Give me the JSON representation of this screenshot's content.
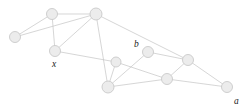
{
  "figure": {
    "background_color": "#ffffff",
    "node_fill_color": "#ececec",
    "node_stroke_color": "#c9c9c9",
    "edge_color": "#c4c4c4",
    "label_color": "#1a1a1a"
  },
  "chart_data": {
    "type": "diagram",
    "title": "",
    "nodes": [
      {
        "id": "n0",
        "x": 15,
        "y": 37,
        "r": 5.5,
        "label": ""
      },
      {
        "id": "n1",
        "x": 52,
        "y": 14,
        "r": 5.5,
        "label": ""
      },
      {
        "id": "n2",
        "x": 96,
        "y": 14,
        "r": 6.0,
        "label": ""
      },
      {
        "id": "n3",
        "x": 55,
        "y": 51,
        "r": 5.5,
        "label": "x"
      },
      {
        "id": "n4",
        "x": 116,
        "y": 62,
        "r": 5.0,
        "label": ""
      },
      {
        "id": "n5",
        "x": 148,
        "y": 52,
        "r": 5.5,
        "label": "b"
      },
      {
        "id": "n6",
        "x": 188,
        "y": 60,
        "r": 5.5,
        "label": ""
      },
      {
        "id": "n7",
        "x": 108,
        "y": 87,
        "r": 6.0,
        "label": ""
      },
      {
        "id": "n8",
        "x": 167,
        "y": 79,
        "r": 5.5,
        "label": ""
      },
      {
        "id": "n9",
        "x": 227,
        "y": 87,
        "r": 5.5,
        "label": "a"
      }
    ],
    "edges": [
      {
        "from": "n0",
        "to": "n1"
      },
      {
        "from": "n0",
        "to": "n2"
      },
      {
        "from": "n1",
        "to": "n3"
      },
      {
        "from": "n1",
        "to": "n2"
      },
      {
        "from": "n2",
        "to": "n3"
      },
      {
        "from": "n2",
        "to": "n7"
      },
      {
        "from": "n2",
        "to": "n6"
      },
      {
        "from": "n3",
        "to": "n4"
      },
      {
        "from": "n4",
        "to": "n7"
      },
      {
        "from": "n4",
        "to": "n8"
      },
      {
        "from": "n5",
        "to": "n7"
      },
      {
        "from": "n5",
        "to": "n6"
      },
      {
        "from": "n6",
        "to": "n8"
      },
      {
        "from": "n6",
        "to": "n9"
      },
      {
        "from": "n7",
        "to": "n8"
      },
      {
        "from": "n8",
        "to": "n9"
      }
    ],
    "labels": [
      {
        "text": "x",
        "x": 52,
        "y": 67,
        "node": "n3"
      },
      {
        "text": "b",
        "x": 134,
        "y": 47,
        "node": "n5"
      },
      {
        "text": "a",
        "x": 234,
        "y": 104,
        "node": "n9"
      }
    ]
  }
}
